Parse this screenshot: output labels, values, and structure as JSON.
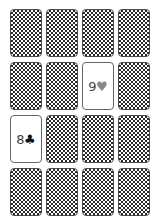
{
  "game": {
    "type": "memory-match",
    "rows": 4,
    "columns": 4
  },
  "colors": {
    "card_back_dark": "#2a2a2a",
    "card_back_light": "#ffffff",
    "card_border": "#4a4a4a",
    "rank_text": "#444444",
    "heart_suit": "#888888",
    "club_suit": "#111111"
  },
  "cards": [
    {
      "index": 0,
      "row": 0,
      "col": 0,
      "state": "face-down"
    },
    {
      "index": 1,
      "row": 0,
      "col": 1,
      "state": "face-down"
    },
    {
      "index": 2,
      "row": 0,
      "col": 2,
      "state": "face-down"
    },
    {
      "index": 3,
      "row": 0,
      "col": 3,
      "state": "face-down"
    },
    {
      "index": 4,
      "row": 1,
      "col": 0,
      "state": "face-down"
    },
    {
      "index": 5,
      "row": 1,
      "col": 1,
      "state": "face-down"
    },
    {
      "index": 6,
      "row": 1,
      "col": 2,
      "state": "face-up",
      "rank": "9",
      "suit": "♥",
      "suit_name": "hearts"
    },
    {
      "index": 7,
      "row": 1,
      "col": 3,
      "state": "face-down"
    },
    {
      "index": 8,
      "row": 2,
      "col": 0,
      "state": "face-up",
      "rank": "8",
      "suit": "♣",
      "suit_name": "clubs"
    },
    {
      "index": 9,
      "row": 2,
      "col": 1,
      "state": "face-down"
    },
    {
      "index": 10,
      "row": 2,
      "col": 2,
      "state": "face-down"
    },
    {
      "index": 11,
      "row": 2,
      "col": 3,
      "state": "face-down"
    },
    {
      "index": 12,
      "row": 3,
      "col": 0,
      "state": "face-down"
    },
    {
      "index": 13,
      "row": 3,
      "col": 1,
      "state": "face-down"
    },
    {
      "index": 14,
      "row": 3,
      "col": 2,
      "state": "face-down"
    },
    {
      "index": 15,
      "row": 3,
      "col": 3,
      "state": "face-down"
    }
  ]
}
